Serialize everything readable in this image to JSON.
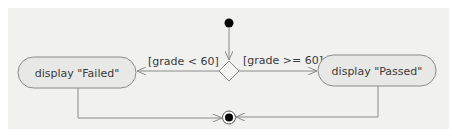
{
  "diagram": {
    "type": "UML activity diagram",
    "colors": {
      "background": "#f1f1f0",
      "action_fill": "#e8e8e6",
      "line": "#8a8a8a",
      "node": "#000000",
      "text": "#3a3a3a"
    },
    "nodes": {
      "initial": {
        "kind": "initial-node"
      },
      "decision": {
        "kind": "decision-node"
      },
      "action_failed": {
        "kind": "action",
        "label": "display \"Failed\""
      },
      "action_passed": {
        "kind": "action",
        "label": "display \"Passed\""
      },
      "final": {
        "kind": "final-node"
      }
    },
    "guards": {
      "fail": "[grade < 60]",
      "pass": "[grade >= 60]"
    },
    "edges": [
      {
        "from": "initial",
        "to": "decision",
        "guard": ""
      },
      {
        "from": "decision",
        "to": "action_failed",
        "guard": "[grade < 60]"
      },
      {
        "from": "decision",
        "to": "action_passed",
        "guard": "[grade >= 60]"
      },
      {
        "from": "action_failed",
        "to": "final",
        "guard": ""
      },
      {
        "from": "action_passed",
        "to": "final",
        "guard": ""
      }
    ]
  }
}
